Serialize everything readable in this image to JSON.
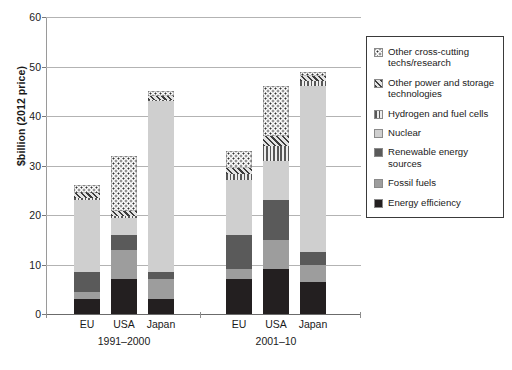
{
  "chart_data": {
    "type": "bar",
    "title": "",
    "subtitle": "",
    "xlabel": "",
    "ylabel": "$billion (2012 price)",
    "ylim": [
      0,
      60
    ],
    "yticks": [
      0,
      10,
      20,
      30,
      40,
      50,
      60
    ],
    "grid": true,
    "stacked": true,
    "legend_position": "right",
    "groups": [
      {
        "label": "1991–2000",
        "categories": [
          "EU",
          "USA",
          "Japan"
        ]
      },
      {
        "label": "2001–10",
        "categories": [
          "EU",
          "USA",
          "Japan"
        ]
      }
    ],
    "categories": [
      "EU",
      "USA",
      "Japan",
      "EU",
      "USA",
      "Japan"
    ],
    "series": [
      {
        "name": "Energy efficiency",
        "pattern": "solid",
        "color": "#231f20",
        "values": [
          3.0,
          7.0,
          3.0,
          7.0,
          9.0,
          6.5
        ]
      },
      {
        "name": "Fossil fuels",
        "pattern": "solid",
        "color": "#9d9d9d",
        "values": [
          1.5,
          6.0,
          4.0,
          2.0,
          6.0,
          3.5
        ]
      },
      {
        "name": "Renewable energy sources",
        "pattern": "solid",
        "color": "#5a5a5a",
        "values": [
          4.0,
          3.0,
          1.5,
          7.0,
          8.0,
          2.5
        ]
      },
      {
        "name": "Nuclear",
        "pattern": "solid",
        "color": "#cfcfcf",
        "values": [
          14.5,
          3.5,
          34.5,
          11.0,
          8.0,
          33.5
        ]
      },
      {
        "name": "Hydrogen and fuel cells",
        "pattern": "vertical-lines",
        "color": "#e9e9e9",
        "values": [
          0.4,
          0.3,
          0.2,
          1.2,
          3.0,
          1.0
        ]
      },
      {
        "name": "Other power and storage technologies",
        "pattern": "diagonal-hatch",
        "color": "#dcdcdc",
        "values": [
          1.1,
          1.0,
          0.8,
          1.3,
          2.0,
          1.0
        ]
      },
      {
        "name": "Other cross-cutting techs/research",
        "pattern": "dotted",
        "color": "#fbfbfb",
        "values": [
          1.5,
          11.2,
          1.0,
          3.5,
          10.0,
          1.0
        ]
      }
    ],
    "totals": [
      26.0,
      32.0,
      45.0,
      33.5,
      46.0,
      49.0
    ]
  },
  "legend": {
    "items": [
      {
        "label": "Other cross-cutting techs/research",
        "swatch": "dotted-swatch"
      },
      {
        "label": "Other power and storage technologies",
        "swatch": "diagonal-hatch-swatch"
      },
      {
        "label": "Hydrogen and fuel cells",
        "swatch": "vertical-lines-swatch"
      },
      {
        "label": "Nuclear",
        "swatch": "light-gray-swatch"
      },
      {
        "label": "Renewable energy sources",
        "swatch": "dark-gray-swatch"
      },
      {
        "label": "Fossil fuels",
        "swatch": "medium-gray-swatch"
      },
      {
        "label": "Energy efficiency",
        "swatch": "black-swatch"
      }
    ]
  }
}
